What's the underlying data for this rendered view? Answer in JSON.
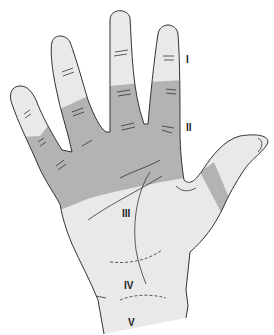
{
  "figure": {
    "colors": {
      "skin_light": "#e9e9e9",
      "zone_dark": "#b3b3b3",
      "outline": "#333333",
      "background": "#ffffff"
    },
    "labels": [
      {
        "id": "I",
        "text": "I",
        "x": 186,
        "y": 54
      },
      {
        "id": "II",
        "text": "II",
        "x": 186,
        "y": 122
      },
      {
        "id": "III",
        "text": "III",
        "x": 122,
        "y": 208
      },
      {
        "id": "IV",
        "text": "IV",
        "x": 124,
        "y": 280
      },
      {
        "id": "V",
        "text": "V",
        "x": 128,
        "y": 317
      }
    ]
  }
}
